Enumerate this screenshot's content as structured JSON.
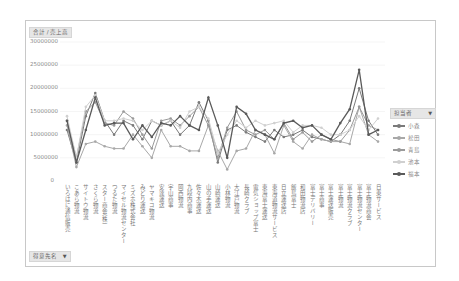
{
  "chart_data": {
    "type": "line",
    "title": "",
    "value_field_label": "合計 / 売上高",
    "xlabel": "",
    "ylabel": "",
    "ylim": [
      0,
      30000000
    ],
    "yticks": [
      "30000000",
      "25000000",
      "20000000",
      "15000000",
      "10000000",
      "5000000",
      "0"
    ],
    "grid": true,
    "legend_position": "right",
    "legend_title": "担当者",
    "categories": [
      "いろはに通信販売",
      "こあら物流",
      "サイトウ物流",
      "さくら物流",
      "スター商会(株)",
      "つるた物流",
      "マイセル物流センター",
      "ミズホ株式会社",
      "みどり運送",
      "ヤマキコ物流",
      "安達運送",
      "宇山商事",
      "岡西物流",
      "九段内商事",
      "佐々木運送",
      "山の手運送",
      "山崎運送",
      "小林物流",
      "大江戸物流",
      "長崎クラブ",
      "電気ショップ富士",
      "東海富士運送",
      "東海道物流サービス",
      "日立運送店",
      "飯島富士",
      "和田物流店",
      "富士デリバリー",
      "富士商事",
      "富士運送販売",
      "富士物流",
      "富士物流クラブ",
      "富士物流センター",
      "富士物流商会",
      "日東サービス"
    ],
    "series": [
      {
        "name": "小森",
        "color": "#7a7a7a",
        "values": [
          11000000,
          4000000,
          14000000,
          19000000,
          13000000,
          10000000,
          13000000,
          12000000,
          9000000,
          13000000,
          12000000,
          13000000,
          10000000,
          12000000,
          17000000,
          13000000,
          4000000,
          11000000,
          12000000,
          10500000,
          9500000,
          8500000,
          11000000,
          9500000,
          10000000,
          11000000,
          9500000,
          9000000,
          8500000,
          10000000,
          13000000,
          20000000,
          13000000,
          10000000
        ]
      },
      {
        "name": "松田",
        "color": "#a8a8a8",
        "values": [
          12000000,
          3000000,
          8000000,
          8500000,
          7500000,
          7000000,
          7000000,
          10000000,
          7500000,
          5000000,
          11000000,
          7500000,
          7500000,
          6500000,
          6500000,
          12000000,
          6500000,
          2500000,
          6500000,
          7000000,
          11000000,
          10000000,
          6000000,
          12000000,
          8500000,
          7000000,
          10000000,
          9000000,
          8500000,
          8500000,
          8000000,
          16000000,
          10000000,
          8500000
        ]
      },
      {
        "name": "青島",
        "color": "#9a9a9a",
        "values": [
          13000000,
          5000000,
          15000000,
          17000000,
          12500000,
          12000000,
          15000000,
          13500000,
          10000000,
          7000000,
          13000000,
          13500000,
          12000000,
          14000000,
          16000000,
          12000000,
          5000000,
          11500000,
          15000000,
          11000000,
          10000000,
          11000000,
          9000000,
          12500000,
          9000000,
          10500000,
          8500000,
          10000000,
          9000000,
          8500000,
          11000000,
          16000000,
          12000000,
          11000000
        ]
      },
      {
        "name": "池本",
        "color": "#d0d0d0",
        "values": [
          14000000,
          5000000,
          16000000,
          18500000,
          13000000,
          13000000,
          13500000,
          13000000,
          11000000,
          13000000,
          12000000,
          13000000,
          11500000,
          15000000,
          16000000,
          13500000,
          6000000,
          10000000,
          13000000,
          11500000,
          13000000,
          12000000,
          12500000,
          13000000,
          10500000,
          12000000,
          12000000,
          11500000,
          10000000,
          10000000,
          11000000,
          14000000,
          11000000,
          13500000
        ]
      },
      {
        "name": "福本",
        "color": "#5a5a5a",
        "values": [
          13000000,
          4000000,
          11000000,
          18000000,
          12000000,
          12500000,
          12500000,
          9000000,
          12000000,
          9500000,
          12500000,
          12000000,
          14000000,
          12000000,
          11000000,
          18000000,
          12000000,
          5000000,
          16000000,
          14500000,
          11000000,
          10000000,
          9000000,
          12500000,
          13000000,
          11500000,
          12000000,
          10000000,
          9000000,
          12500000,
          15500000,
          24000000,
          10000000,
          11000000
        ]
      }
    ]
  },
  "ui": {
    "value_field_button": "合計 / 売上高",
    "legend_field_button": "担当者",
    "axis_field_button": "得意先名",
    "dropdown_glyph": "▼"
  }
}
